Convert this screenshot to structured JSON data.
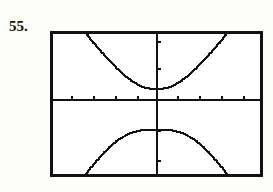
{
  "page": {
    "background_color": "#fdfdfb",
    "ink_color": "#111111"
  },
  "problem": {
    "number_label": "55."
  },
  "calculator_screen": {
    "name": "graphing-calculator-viewport",
    "frame": {
      "x": 50,
      "y": 31,
      "width": 213,
      "height": 146,
      "border_width": 3,
      "border_color": "#111111",
      "fill_color": "#ffffff"
    },
    "axes": {
      "x_axis_y": 69,
      "y_axis_x": 107,
      "line_width": 2,
      "color": "#111111",
      "x_ticks": [
        22,
        44,
        66,
        88,
        128,
        150,
        172,
        194
      ],
      "y_ticks": [
        11,
        38,
        100,
        130
      ],
      "tick_length": 4
    }
  },
  "chart_data": {
    "type": "line",
    "title": "",
    "subtitle": "",
    "xlabel": "",
    "ylabel": "",
    "grid": false,
    "legend": null,
    "axis_style": "calculator-window-with-tick-marks",
    "xlim": [
      -4.84,
      4.84
    ],
    "ylim": [
      -3.5,
      3.3
    ],
    "x_tick_interval": 1,
    "y_tick_interval": 1,
    "series": [
      {
        "name": "upper-branch",
        "points": [
          [
            -3.3,
            3.3
          ],
          [
            -3.1,
            3.05
          ],
          [
            -2.9,
            2.8
          ],
          [
            -2.7,
            2.56
          ],
          [
            -2.5,
            2.33
          ],
          [
            -2.3,
            2.1
          ],
          [
            -2.1,
            1.88
          ],
          [
            -1.9,
            1.67
          ],
          [
            -1.7,
            1.47
          ],
          [
            -1.5,
            1.28
          ],
          [
            -1.3,
            1.11
          ],
          [
            -1.1,
            0.96
          ],
          [
            -0.9,
            0.83
          ],
          [
            -0.7,
            0.73
          ],
          [
            -0.5,
            0.66
          ],
          [
            -0.3,
            0.61
          ],
          [
            -0.1,
            0.6
          ],
          [
            0.1,
            0.6
          ],
          [
            0.3,
            0.61
          ],
          [
            0.5,
            0.66
          ],
          [
            0.7,
            0.73
          ],
          [
            0.9,
            0.83
          ],
          [
            1.1,
            0.96
          ],
          [
            1.3,
            1.11
          ],
          [
            1.5,
            1.28
          ],
          [
            1.7,
            1.47
          ],
          [
            1.9,
            1.67
          ],
          [
            2.1,
            1.88
          ],
          [
            2.3,
            2.1
          ],
          [
            2.5,
            2.33
          ],
          [
            2.7,
            2.56
          ],
          [
            2.9,
            2.8
          ],
          [
            3.1,
            3.05
          ],
          [
            3.3,
            3.3
          ]
        ]
      },
      {
        "name": "lower-branch",
        "points": [
          [
            -3.3,
            -3.5
          ],
          [
            -3.1,
            -3.22
          ],
          [
            -2.9,
            -2.97
          ],
          [
            -2.7,
            -2.73
          ],
          [
            -2.5,
            -2.5
          ],
          [
            -2.3,
            -2.28
          ],
          [
            -2.1,
            -2.08
          ],
          [
            -1.9,
            -1.9
          ],
          [
            -1.7,
            -1.75
          ],
          [
            -1.5,
            -1.62
          ],
          [
            -1.3,
            -1.51
          ],
          [
            -1.1,
            -1.43
          ],
          [
            -0.9,
            -1.37
          ],
          [
            -0.7,
            -1.33
          ],
          [
            -0.5,
            -1.31
          ],
          [
            -0.3,
            -1.3
          ],
          [
            -0.1,
            -1.3
          ],
          [
            0.1,
            -1.3
          ],
          [
            0.3,
            -1.3
          ],
          [
            0.5,
            -1.31
          ],
          [
            0.7,
            -1.33
          ],
          [
            0.9,
            -1.37
          ],
          [
            1.1,
            -1.43
          ],
          [
            1.3,
            -1.51
          ],
          [
            1.5,
            -1.62
          ],
          [
            1.7,
            -1.75
          ],
          [
            1.9,
            -1.9
          ],
          [
            2.1,
            -2.08
          ],
          [
            2.3,
            -2.28
          ],
          [
            2.5,
            -2.5
          ],
          [
            2.7,
            -2.73
          ],
          [
            2.9,
            -2.97
          ],
          [
            3.1,
            -3.22
          ],
          [
            3.3,
            -3.5
          ]
        ]
      }
    ]
  }
}
